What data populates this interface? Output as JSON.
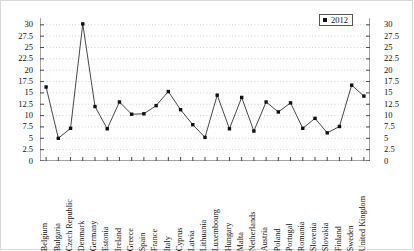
{
  "chart_data": {
    "type": "line",
    "title": "",
    "subtitle": "",
    "xlabel": "",
    "ylabel": "",
    "ylim": [
      0,
      31.5
    ],
    "y_ticks": [
      "0",
      "2.5",
      "5",
      "7.5",
      "10",
      "12.5",
      "15",
      "17.5",
      "20",
      "22.5",
      "25",
      "27.5",
      "30"
    ],
    "y_ticks_right": [
      "0",
      "2.5",
      "5",
      "7.5",
      "10",
      "12.5",
      "15",
      "17.5",
      "20",
      "22.5",
      "25",
      "27.5",
      "30"
    ],
    "grid": true,
    "legend_position": "top-right",
    "dual_axis": true,
    "marker": "square",
    "marker_color": "#111111",
    "line_color": "#333333",
    "categories": [
      "Belgium",
      "Bulgaria",
      "Czech Republic",
      "Denmark",
      "Germany",
      "Estonia",
      "Ireland",
      "Greece",
      "Spain",
      "France",
      "Italy",
      "Cyprus",
      "Latvia",
      "Lithuania",
      "Luxembourg",
      "Hungary",
      "Malta",
      "Netherlands",
      "Austria",
      "Poland",
      "Portugal",
      "Romania",
      "Slovenia",
      "Slovakia",
      "Finland",
      "Sweden",
      "United Kingdom"
    ],
    "series": [
      {
        "name": "2012",
        "values": [
          16.3,
          5.0,
          7.2,
          30.2,
          12.0,
          7.1,
          13.0,
          10.3,
          10.4,
          12.2,
          15.3,
          11.3,
          8.0,
          5.2,
          14.5,
          7.1,
          14.0,
          6.6,
          13.0,
          10.8,
          12.8,
          7.2,
          9.4,
          6.2,
          7.6,
          16.7,
          14.3
        ]
      }
    ]
  },
  "legend": {
    "entries": [
      {
        "label": "2012",
        "color": "#111111"
      }
    ]
  }
}
